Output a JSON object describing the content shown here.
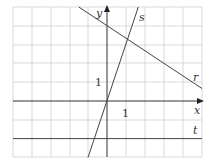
{
  "diagram": {
    "type": "coordinate-grid-with-lines",
    "grid": {
      "x_range": [
        -5,
        5
      ],
      "y_range": [
        -3,
        5
      ],
      "unit_px": 18.8,
      "origin_px": [
        107,
        101
      ]
    },
    "axes": {
      "x_label": "x",
      "y_label": "y",
      "x_tick_label": "1",
      "y_tick_label": "1"
    },
    "lines": [
      {
        "name": "r",
        "label": "r",
        "equation": "y = -2/3 x + 4"
      },
      {
        "name": "s",
        "label": "s",
        "equation": "y = 3x"
      },
      {
        "name": "t",
        "label": "t",
        "equation": "y = -2"
      }
    ],
    "colors": {
      "grid": "#c8c8c8",
      "axis": "#333333",
      "line": "#444444"
    }
  }
}
